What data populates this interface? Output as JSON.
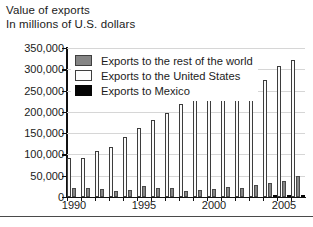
{
  "title": "Value of exports",
  "subtitle": "In millions of U.S. dollars",
  "legend": {
    "items": [
      {
        "key": "world",
        "label": "Exports to the rest of the world",
        "color": "#858585"
      },
      {
        "key": "usa",
        "label": "Exports to the United States",
        "color": "#fbfbfb"
      },
      {
        "key": "mexico",
        "label": "Exports to Mexico",
        "color": "#050505"
      }
    ]
  },
  "chart_data": {
    "type": "bar",
    "title": "Value of exports",
    "subtitle": "In millions of U.S. dollars",
    "xlabel": "",
    "ylabel": "In millions of U.S. dollars",
    "ylim": [
      0,
      350000
    ],
    "ytick_labels": [
      "0",
      "50,000",
      "100,000",
      "150,000",
      "200,000",
      "250,000",
      "300,000",
      "350,000"
    ],
    "yticks": [
      0,
      50000,
      100000,
      150000,
      200000,
      250000,
      300000,
      350000
    ],
    "grid": true,
    "legend_position": "upper-left-inside",
    "categories": [
      1990,
      1991,
      1992,
      1993,
      1994,
      1995,
      1996,
      1997,
      1998,
      1999,
      2000,
      2001,
      2002,
      2003,
      2004,
      2005,
      2006
    ],
    "xtick_labels": [
      "1990",
      "1995",
      "2000",
      "2005"
    ],
    "xticks": [
      1990,
      1995,
      2000,
      2005
    ],
    "series": [
      {
        "name": "Exports to the United States",
        "key": "usa",
        "color": "#fbfbfb",
        "values": [
          92000,
          92000,
          108000,
          118000,
          140000,
          162000,
          180000,
          198000,
          218000,
          244000,
          265000,
          254000,
          254000,
          260000,
          276000,
          308000,
          322000
        ]
      },
      {
        "name": "Exports to the rest of the world",
        "key": "world",
        "color": "#858585",
        "values": [
          22000,
          22000,
          20000,
          15000,
          17000,
          25000,
          22000,
          21000,
          15000,
          16000,
          20000,
          23000,
          22000,
          28000,
          32000,
          38000,
          50000
        ]
      },
      {
        "name": "Exports to Mexico",
        "key": "mexico",
        "color": "#050505",
        "values": [
          0,
          0,
          0,
          0,
          0,
          0,
          0,
          0,
          0,
          0,
          0,
          0,
          0,
          0,
          1500,
          2500,
          3000
        ]
      }
    ]
  }
}
